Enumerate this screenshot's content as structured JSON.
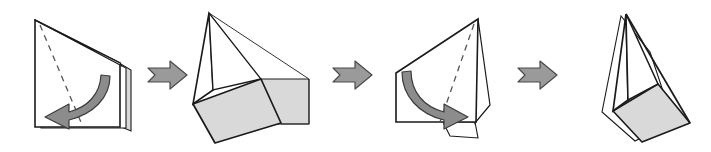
{
  "diagram": {
    "background_color": "#ffffff",
    "step_count": 4,
    "arrow_count": 3,
    "colors": {
      "outline": "#1a1a1a",
      "thin_outline": "#333333",
      "shade_fill": "#d9d9d9",
      "shade_fill_light": "#e8e8e8",
      "arrow_fill": "#9a9a9a",
      "arrow_stroke": "#4a4a4a",
      "fold_arrow_fill": "#8c8c8c",
      "fold_arrow_stroke": "#3c3c3c",
      "crease_dash": "#555555",
      "paper_fill": "#ffffff"
    },
    "steps": [
      {
        "index": 1,
        "name": "folded-sheet-with-left-fold",
        "label": "Step 1",
        "description": "Folded sheet standing on edge with a dashed crease line and a curved arrow sweeping to the lower left",
        "has_crease": true,
        "has_fold_arrow": true,
        "fold_direction": "left",
        "shaded_faces": 1
      },
      {
        "index": 2,
        "name": "opened-form-two-shaded-faces",
        "label": "Step 2",
        "description": "Opened form showing a tall triangular peak above two light gray shaded quadrilateral faces",
        "has_crease": false,
        "has_fold_arrow": false,
        "fold_direction": "none",
        "shaded_faces": 2
      },
      {
        "index": 3,
        "name": "folded-sheet-with-right-fold",
        "label": "Step 3",
        "description": "Mirrored folded sheet with a dashed crease line and a curved arrow sweeping to the lower right",
        "has_crease": true,
        "has_fold_arrow": true,
        "fold_direction": "right",
        "shaded_faces": 0
      },
      {
        "index": 4,
        "name": "narrow-kite-form",
        "label": "Step 4",
        "description": "Narrow kite shaped form with a gray shaded quadrilateral panel at the lower right",
        "has_crease": false,
        "has_fold_arrow": false,
        "fold_direction": "none",
        "shaded_faces": 1
      }
    ],
    "arrows": [
      {
        "index": 1,
        "name": "step-arrow-1",
        "direction": "right",
        "between": "step 1 and step 2"
      },
      {
        "index": 2,
        "name": "step-arrow-2",
        "direction": "right",
        "between": "step 2 and step 3"
      },
      {
        "index": 3,
        "name": "step-arrow-3",
        "direction": "right",
        "between": "step 3 and step 4"
      }
    ]
  }
}
